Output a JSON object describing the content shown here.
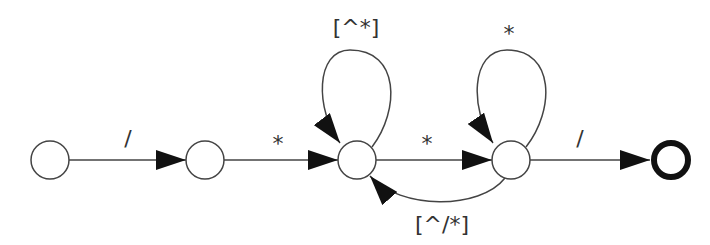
{
  "diagram": {
    "type": "finite-state-automaton",
    "states": [
      {
        "id": "s0",
        "x": 50,
        "y": 160,
        "final": false
      },
      {
        "id": "s1",
        "x": 205,
        "y": 160,
        "final": false
      },
      {
        "id": "s2",
        "x": 357,
        "y": 160,
        "final": false
      },
      {
        "id": "s3",
        "x": 511,
        "y": 160,
        "final": false
      },
      {
        "id": "s4",
        "x": 671,
        "y": 160,
        "final": true
      }
    ],
    "transitions": [
      {
        "from": "s0",
        "to": "s1",
        "label": "/"
      },
      {
        "from": "s1",
        "to": "s2",
        "label": "*"
      },
      {
        "from": "s2",
        "to": "s2",
        "label": "[^*]"
      },
      {
        "from": "s2",
        "to": "s3",
        "label": "*"
      },
      {
        "from": "s3",
        "to": "s3",
        "label": "*"
      },
      {
        "from": "s3",
        "to": "s2",
        "label": "[^/*]"
      },
      {
        "from": "s3",
        "to": "s4",
        "label": "/"
      }
    ]
  }
}
